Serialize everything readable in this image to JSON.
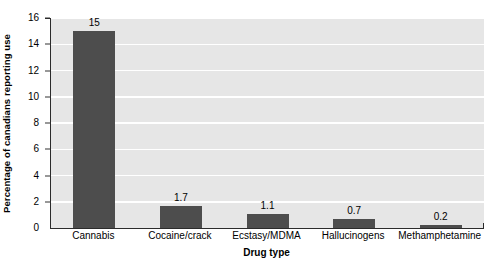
{
  "chart_data": {
    "type": "bar",
    "title": "",
    "subtitle": "",
    "xlabel": "Drug type",
    "ylabel": "Percentage of canadians reporting use",
    "categories": [
      "Cannabis",
      "Cocaine/crack",
      "Ecstasy/MDMA",
      "Hallucinogens",
      "Methamphetamine"
    ],
    "values": [
      15,
      1.7,
      1.1,
      0.7,
      0.2
    ],
    "data_labels": [
      "15",
      "1.7",
      "1.1",
      "0.7",
      "0.2"
    ],
    "ylim": [
      0,
      16
    ],
    "ytick_step": 2,
    "ytick_labels": [
      "0",
      "2",
      "4",
      "6",
      "8",
      "10",
      "12",
      "14",
      "16"
    ],
    "grid": "horizontal",
    "legend": "none",
    "colors": {
      "bar": "#4d4d4d",
      "plot_background": "#e6e6e6",
      "gridline": "#ffffff",
      "axis": "#2b2b2b",
      "text": "#000000",
      "figure_background": "#ffffff"
    }
  }
}
